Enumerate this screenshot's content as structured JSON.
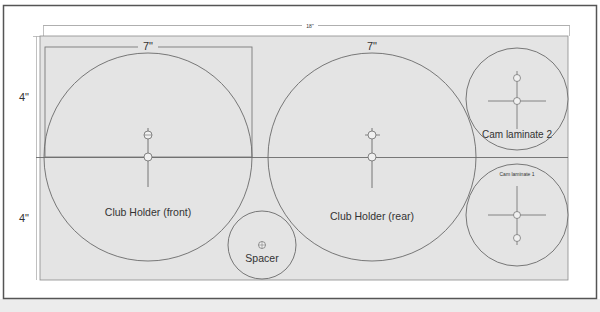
{
  "diagram": {
    "type": "cut-layout",
    "colors": {
      "frame": "#555555",
      "board_fill": "#e4e4e4",
      "line": "#6a6a6a",
      "text": "#333333",
      "background": "#ffffff"
    },
    "dimensions": {
      "overall_width": "18\"",
      "top_piece_width": "7\"",
      "rear_piece_width": "7\"",
      "upper_height": "4\"",
      "lower_height": "4\""
    },
    "parts": [
      {
        "id": "club-holder-front",
        "label": "Club Holder (front)"
      },
      {
        "id": "club-holder-rear",
        "label": "Club Holder (rear)"
      },
      {
        "id": "spacer",
        "label": "Spacer"
      },
      {
        "id": "cam-laminate-2",
        "label": "Cam laminate 2"
      },
      {
        "id": "cam-laminate-1",
        "label": "Cam laminate 1"
      }
    ]
  }
}
